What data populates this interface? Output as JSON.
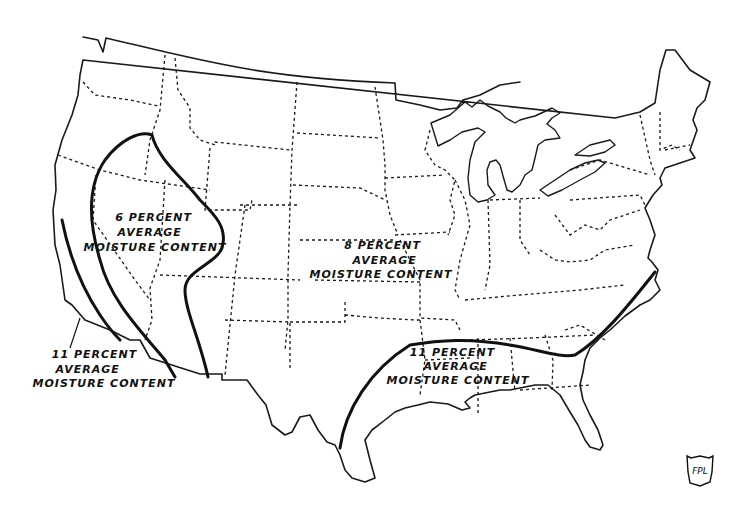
{
  "map": {
    "subject": "Contiguous United States — average equilibrium moisture content zones",
    "colors": {
      "ink": "#111111",
      "background": "#ffffff"
    },
    "zones": [
      {
        "id": "zone-6",
        "lines": [
          "6 PERCENT",
          "AVERAGE",
          "MOISTURE CONTENT"
        ],
        "region": "Interior West (Nevada, Utah, Arizona)"
      },
      {
        "id": "zone-8",
        "lines": [
          "8 PERCENT",
          "AVERAGE",
          "MOISTURE CONTENT"
        ],
        "region": "Most of the United States"
      },
      {
        "id": "zone-11-west",
        "lines": [
          "11 PERCENT",
          "AVERAGE",
          "MOISTURE CONTENT"
        ],
        "region": "Southern California coast"
      },
      {
        "id": "zone-11-south",
        "lines": [
          "11 PERCENT",
          "AVERAGE",
          "MOISTURE CONTENT"
        ],
        "region": "Gulf and Southeast coast"
      }
    ],
    "logo": {
      "text": "FPL"
    }
  }
}
